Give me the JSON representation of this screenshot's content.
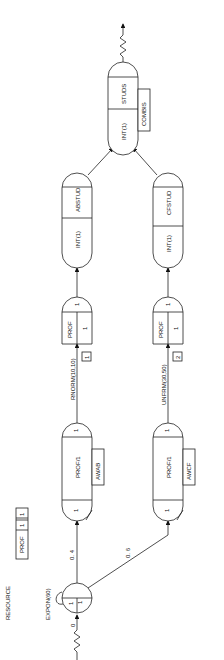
{
  "resource": {
    "title": "RESOURCE",
    "name": "PROF",
    "capacity": "1",
    "count": "1"
  },
  "start": {
    "label": "EXPON(60)",
    "first": "0",
    "left": "1",
    "right": "1"
  },
  "branches": {
    "upper_prob": "0. 4",
    "lower_prob": "0. 6"
  },
  "upper": {
    "await": {
      "label": "PROF/1",
      "file": "AWAB",
      "top": "1",
      "bottom": "1"
    },
    "activity": "RNORM(10,10)",
    "activity_num": "1",
    "free": {
      "label": "PROF",
      "qty": "1",
      "top": "1"
    },
    "assign": {
      "top": "ABSTUD",
      "bottom": "INT(1)"
    }
  },
  "lower": {
    "await": {
      "label": "PROF/1",
      "file": "AWCF",
      "top": "1",
      "bottom": "1"
    },
    "activity": "UNFRM(30,50)",
    "activity_num": "2",
    "free": {
      "label": "PROF",
      "qty": "1",
      "top": "1"
    },
    "assign": {
      "top": "CFSTUD",
      "bottom": "INT(1)"
    }
  },
  "collect": {
    "top": "STUDS",
    "bottom": "INT(1)",
    "file": "COMBIS"
  }
}
